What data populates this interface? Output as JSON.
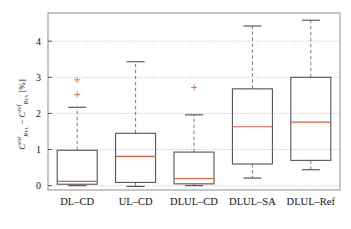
{
  "chart_data": {
    "type": "box",
    "title": "",
    "xlabel": "",
    "ylabel": "C_{R_TA}^{est} - C_{R_TA}^{ref} [%]",
    "ylabel_parts": {
      "sym1": "C",
      "sup1": "est",
      "sub1": "R",
      "sub1b": "TA",
      "minus": " − ",
      "sym2": "C",
      "sup2": "ref",
      "sub2": "R",
      "sub2b": "TA",
      "units": " [%]"
    },
    "categories": [
      "DL–CD",
      "UL–CD",
      "DLUL–CD",
      "DLUL–SA",
      "DLUL–Ref"
    ],
    "yticks": [
      0,
      1,
      2,
      3,
      4
    ],
    "ytick_labels": [
      "0",
      "1",
      "2",
      "3",
      "4"
    ],
    "ylim": [
      -0.12,
      4.78
    ],
    "grid": true,
    "grid_style": "dotted",
    "legend": "none",
    "boxes": [
      {
        "category": "DL–CD",
        "whisker_low": 0.0,
        "q1": 0.04,
        "median": 0.12,
        "q3": 0.98,
        "whisker_high": 2.17,
        "outliers": [
          2.52,
          2.93
        ]
      },
      {
        "category": "UL–CD",
        "whisker_low": -0.02,
        "q1": 0.09,
        "median": 0.81,
        "q3": 1.45,
        "whisker_high": 3.43,
        "outliers": []
      },
      {
        "category": "DLUL–CD",
        "whisker_low": 0.0,
        "q1": 0.05,
        "median": 0.2,
        "q3": 0.93,
        "whisker_high": 1.96,
        "outliers": [
          2.72
        ]
      },
      {
        "category": "DLUL–SA",
        "whisker_low": 0.21,
        "q1": 0.6,
        "median": 1.63,
        "q3": 2.68,
        "whisker_high": 4.42,
        "outliers": []
      },
      {
        "category": "DLUL–Ref",
        "whisker_low": 0.44,
        "q1": 0.7,
        "median": 1.76,
        "q3": 3.0,
        "whisker_high": 4.58,
        "outliers": []
      }
    ],
    "colors": {
      "box_edge": "#4a4a5a",
      "median": "#d9603b",
      "whisker": "#7a7a88",
      "cap": "#4a4a5a",
      "outlier": "#e06040",
      "grid": "#b8b8b8",
      "axis": "#9a9a9a",
      "background": "#ffffff"
    }
  }
}
